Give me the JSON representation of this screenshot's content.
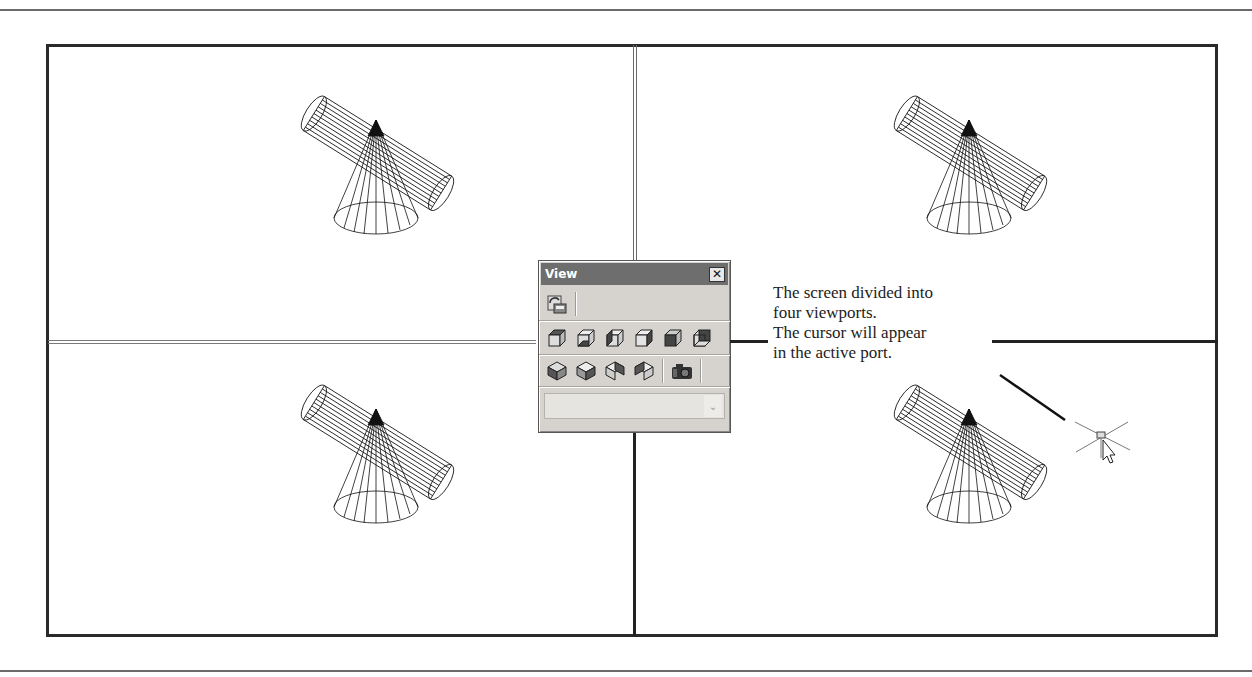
{
  "layout": {
    "viewport_count": 4,
    "active_viewport": "bottom-right",
    "border_color": "#2a2a2a",
    "inactive_divider_color": "#7a7a7a"
  },
  "viewports": [
    {
      "id": "top-left",
      "model": "cone-cylinder-wireframe",
      "active": false
    },
    {
      "id": "top-right",
      "model": "cone-cylinder-wireframe",
      "active": false
    },
    {
      "id": "bottom-left",
      "model": "cone-cylinder-wireframe",
      "active": false
    },
    {
      "id": "bottom-right",
      "model": "cone-cylinder-wireframe",
      "active": true
    }
  ],
  "view_toolbar": {
    "title": "View",
    "close_label": "✕",
    "title_bar_color": "#6e6e6e",
    "body_color": "#d6d3ce",
    "row1": [
      {
        "icon": "named-views-icon"
      }
    ],
    "row2": [
      {
        "icon": "top-view-icon"
      },
      {
        "icon": "bottom-view-icon"
      },
      {
        "icon": "left-view-icon"
      },
      {
        "icon": "right-view-icon"
      },
      {
        "icon": "front-view-icon"
      },
      {
        "icon": "back-view-icon"
      }
    ],
    "row3": [
      {
        "icon": "sw-isometric-icon"
      },
      {
        "icon": "se-isometric-icon"
      },
      {
        "icon": "ne-isometric-icon"
      },
      {
        "icon": "nw-isometric-icon"
      },
      {
        "icon": "camera-icon"
      }
    ],
    "combo_value": "",
    "combo_arrow": "⌄"
  },
  "callout": {
    "lines": [
      "The screen divided into",
      "four viewports.",
      "The cursor will appear",
      "in the active port."
    ]
  },
  "cursor": {
    "type": "crosshair-with-arrow",
    "location": "bottom-right viewport"
  }
}
